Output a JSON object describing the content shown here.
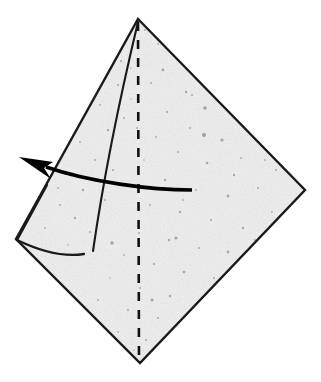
{
  "figure": {
    "canvas": {
      "width": 321,
      "height": 382
    },
    "background_color": "#ffffff"
  },
  "colors": {
    "paper_fill": "#f4f4f4",
    "outline": "#1a1a1a",
    "dashed_fold": "#111111",
    "arrow": "#000000",
    "speckle": "#8d8d8d"
  },
  "shapes": {
    "paper_body": {
      "name": "kite-paper-body",
      "points": "138,19 305,190 140,363 16,239",
      "vertices": {
        "apex_top": [
          138,
          19
        ],
        "corner_right": [
          305,
          190
        ],
        "point_bottom": [
          140,
          363
        ],
        "corner_left": [
          16,
          239
        ]
      }
    },
    "center_fold": {
      "name": "vertical-dashed-fold",
      "type": "valley-fold-dashed",
      "path": "M 138,22 L 139,363",
      "dash_pattern": "9 9"
    },
    "flap_crease": {
      "name": "flap-crease-line",
      "type": "raw-edge",
      "path": "M 138,22 C 121,93 104,175 93,251"
    },
    "flap_bottom_edge": {
      "name": "flap-lower-edge",
      "type": "raw-edge-curved",
      "path": "M 17,240 C 44,253 66,257 84,254"
    },
    "flap_left_edge": {
      "name": "flap-left-edge",
      "type": "raw-edge",
      "path": "M 17,240 L 47,185"
    }
  },
  "arrow": {
    "name": "fold-direction-arrow",
    "label": "swing flap to upper left",
    "direction": "right-to-left",
    "shaft_path": "M 192,190 C 150,190 90,182 46,167",
    "head_tip": [
      19,
      157
    ],
    "head_points": "19,157 53,162 44,168 51,179",
    "tail_point": [
      192,
      190
    ]
  },
  "speckles": [
    [
      172,
      52,
      1.3
    ],
    [
      196,
      63,
      1.0
    ],
    [
      158,
      44,
      0.9
    ],
    [
      210,
      78,
      1.5
    ],
    [
      121,
      61,
      1.1
    ],
    [
      186,
      92,
      1.2
    ],
    [
      229,
      95,
      1.0
    ],
    [
      151,
      83,
      0.9
    ],
    [
      205,
      108,
      1.8
    ],
    [
      167,
      112,
      1.1
    ],
    [
      243,
      118,
      1.3
    ],
    [
      131,
      99,
      0.8
    ],
    [
      190,
      128,
      1.0
    ],
    [
      222,
      140,
      1.6
    ],
    [
      156,
      137,
      0.9
    ],
    [
      263,
      135,
      1.2
    ],
    [
      178,
      152,
      1.0
    ],
    [
      207,
      163,
      1.3
    ],
    [
      241,
      158,
      0.9
    ],
    [
      144,
      160,
      0.8
    ],
    [
      276,
      170,
      1.1
    ],
    [
      165,
      180,
      1.2
    ],
    [
      196,
      190,
      1.0
    ],
    [
      228,
      196,
      1.4
    ],
    [
      258,
      188,
      1.0
    ],
    [
      150,
      205,
      0.9
    ],
    [
      180,
      212,
      1.3
    ],
    [
      211,
      220,
      1.1
    ],
    [
      243,
      228,
      1.2
    ],
    [
      272,
      212,
      0.9
    ],
    [
      139,
      233,
      1.0
    ],
    [
      169,
      240,
      1.2
    ],
    [
      199,
      248,
      0.9
    ],
    [
      228,
      252,
      1.4
    ],
    [
      255,
      240,
      1.0
    ],
    [
      124,
      255,
      0.9
    ],
    [
      154,
      264,
      1.1
    ],
    [
      184,
      272,
      1.3
    ],
    [
      214,
      278,
      1.0
    ],
    [
      238,
      266,
      1.1
    ],
    [
      110,
      278,
      0.8
    ],
    [
      140,
      288,
      1.0
    ],
    [
      170,
      296,
      1.2
    ],
    [
      200,
      300,
      0.9
    ],
    [
      221,
      288,
      1.0
    ],
    [
      98,
      300,
      0.9
    ],
    [
      128,
      310,
      1.1
    ],
    [
      158,
      318,
      1.0
    ],
    [
      186,
      318,
      1.2
    ],
    [
      205,
      305,
      0.8
    ],
    [
      118,
      332,
      0.9
    ],
    [
      146,
      340,
      1.0
    ],
    [
      170,
      334,
      1.1
    ],
    [
      134,
      350,
      0.8
    ],
    [
      158,
      348,
      0.9
    ],
    [
      60,
      205,
      1.0
    ],
    [
      75,
      218,
      1.2
    ],
    [
      45,
      228,
      0.9
    ],
    [
      90,
      232,
      1.1
    ],
    [
      68,
      245,
      0.8
    ],
    [
      105,
      200,
      1.0
    ],
    [
      83,
      190,
      1.2
    ],
    [
      58,
      188,
      0.9
    ],
    [
      113,
      170,
      1.1
    ],
    [
      95,
      160,
      1.0
    ],
    [
      80,
      142,
      0.9
    ],
    [
      108,
      130,
      1.2
    ],
    [
      124,
      118,
      1.0
    ],
    [
      100,
      105,
      0.9
    ],
    [
      118,
      85,
      1.1
    ],
    [
      131,
      68,
      0.8
    ],
    [
      145,
      30,
      0.9
    ],
    [
      163,
      70,
      1.4
    ],
    [
      219,
      55,
      0.9
    ],
    [
      251,
      105,
      1.0
    ],
    [
      286,
      155,
      1.1
    ],
    [
      176,
      238,
      1.6
    ],
    [
      204,
      135,
      2.0
    ],
    [
      234,
      175,
      1.2
    ],
    [
      152,
      300,
      1.5
    ],
    [
      112,
      243,
      1.7
    ],
    [
      192,
      95,
      1.0
    ],
    [
      265,
      160,
      0.9
    ],
    [
      137,
      128,
      1.0
    ],
    [
      183,
      200,
      0.9
    ]
  ]
}
